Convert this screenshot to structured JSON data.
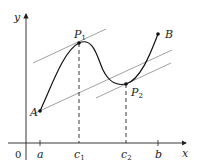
{
  "diagram": {
    "axes": {
      "x_label": "x",
      "y_label": "y",
      "origin_label": "0"
    },
    "ticks": [
      {
        "label": "a",
        "sub": ""
      },
      {
        "label": "c",
        "sub": "1"
      },
      {
        "label": "c",
        "sub": "2"
      },
      {
        "label": "b",
        "sub": ""
      }
    ],
    "points": {
      "A": {
        "label": "A",
        "sub": ""
      },
      "P1": {
        "label": "P",
        "sub": "1"
      },
      "P2": {
        "label": "P",
        "sub": "2"
      },
      "B": {
        "label": "B",
        "sub": ""
      }
    },
    "colors": {
      "curve": "#111111",
      "lines": "#888888",
      "axes": "#222222"
    }
  }
}
